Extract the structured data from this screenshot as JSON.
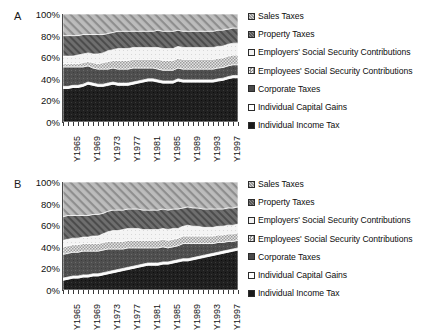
{
  "figure": {
    "panels": [
      {
        "id": "A",
        "label": "A"
      },
      {
        "id": "B",
        "label": "B"
      }
    ]
  },
  "axis": {
    "y_ticks": [
      "100%",
      "80%",
      "60%",
      "40%",
      "20%",
      "0%"
    ],
    "x_ticks": [
      "Y1965",
      "Y1969",
      "Y1973",
      "Y1977",
      "Y1981",
      "Y1985",
      "Y1989",
      "Y1993",
      "Y1997"
    ]
  },
  "legend": {
    "items": [
      {
        "label": "Sales Taxes",
        "swatch": "diagonal-hatch-medium",
        "color": "#9a9a9a"
      },
      {
        "label": "Property Taxes",
        "swatch": "dark-diagonal-hatch",
        "color": "#5a5a5a"
      },
      {
        "label": "Employers' Social Security Contributions",
        "swatch": "white-solid",
        "color": "#f2f2f2"
      },
      {
        "label": "Employees' Social Security Contributions",
        "swatch": "checker-grid",
        "color": "#bdbdbd"
      },
      {
        "label": "Corporate Taxes",
        "swatch": "dark-solid-grey",
        "color": "#4a4a4a"
      },
      {
        "label": "Individual Capital Gains",
        "swatch": "white-outline",
        "color": "#ffffff"
      },
      {
        "label": "Individual Income Tax",
        "swatch": "black-solid",
        "color": "#1a1a1a"
      }
    ]
  },
  "chart_data": [
    {
      "type": "area",
      "panel": "A",
      "title": "",
      "xlabel": "",
      "ylabel": "",
      "ylim": [
        0,
        100
      ],
      "stacked": true,
      "normalized_percent": true,
      "grid": false,
      "legend_position": "right",
      "x": [
        "Y1964",
        "Y1965",
        "Y1966",
        "Y1967",
        "Y1968",
        "Y1969",
        "Y1970",
        "Y1971",
        "Y1972",
        "Y1973",
        "Y1974",
        "Y1975",
        "Y1976",
        "Y1977",
        "Y1978",
        "Y1979",
        "Y1980",
        "Y1981",
        "Y1982",
        "Y1983",
        "Y1984",
        "Y1985",
        "Y1986",
        "Y1987",
        "Y1988",
        "Y1989",
        "Y1990",
        "Y1991",
        "Y1992",
        "Y1993",
        "Y1994",
        "Y1995",
        "Y1996",
        "Y1997",
        "Y1998",
        "Y1999"
      ],
      "series": [
        {
          "name": "Individual Income Tax",
          "values": [
            31,
            31,
            32,
            32,
            33,
            35,
            34,
            33,
            33,
            34,
            35,
            34,
            34,
            34,
            35,
            36,
            37,
            38,
            38,
            37,
            36,
            36,
            36,
            38,
            37,
            37,
            37,
            37,
            37,
            37,
            37,
            38,
            39,
            40,
            41,
            41
          ]
        },
        {
          "name": "Individual Capital Gains",
          "values": [
            2,
            2,
            2,
            2,
            2,
            2,
            2,
            2,
            2,
            2,
            2,
            2,
            2,
            2,
            2,
            2,
            2,
            2,
            2,
            2,
            2,
            2,
            2,
            2,
            2,
            2,
            2,
            2,
            2,
            2,
            2,
            2,
            2,
            2,
            2,
            2
          ]
        },
        {
          "name": "Corporate Taxes",
          "values": [
            18,
            18,
            17,
            17,
            16,
            15,
            14,
            14,
            14,
            13,
            13,
            13,
            13,
            13,
            13,
            12,
            11,
            10,
            10,
            10,
            10,
            10,
            10,
            10,
            10,
            10,
            10,
            10,
            10,
            10,
            10,
            10,
            10,
            10,
            10,
            10
          ]
        },
        {
          "name": "Employees' Social Security Contributions",
          "values": [
            3,
            3,
            3,
            3,
            4,
            4,
            5,
            5,
            6,
            7,
            7,
            8,
            8,
            8,
            8,
            8,
            8,
            8,
            8,
            9,
            9,
            9,
            9,
            9,
            9,
            9,
            9,
            9,
            9,
            9,
            9,
            9,
            9,
            9,
            9,
            9
          ]
        },
        {
          "name": "Employers' Social Security Contributions",
          "values": [
            7,
            7,
            7,
            8,
            8,
            8,
            8,
            9,
            9,
            10,
            10,
            11,
            11,
            11,
            11,
            11,
            11,
            11,
            11,
            11,
            11,
            11,
            11,
            11,
            11,
            11,
            11,
            11,
            11,
            11,
            11,
            11,
            11,
            11,
            11,
            11
          ]
        },
        {
          "name": "Property Taxes",
          "values": [
            19,
            19,
            19,
            18,
            18,
            17,
            18,
            18,
            17,
            16,
            16,
            16,
            16,
            16,
            15,
            15,
            15,
            15,
            15,
            16,
            16,
            16,
            16,
            15,
            15,
            15,
            15,
            15,
            15,
            15,
            15,
            15,
            15,
            14,
            14,
            14
          ]
        },
        {
          "name": "Sales Taxes",
          "values": [
            20,
            20,
            20,
            20,
            19,
            19,
            19,
            19,
            19,
            18,
            17,
            16,
            16,
            16,
            16,
            16,
            16,
            16,
            16,
            15,
            16,
            16,
            16,
            15,
            16,
            16,
            16,
            16,
            16,
            16,
            16,
            15,
            15,
            14,
            13,
            13
          ]
        }
      ]
    },
    {
      "type": "area",
      "panel": "B",
      "title": "",
      "xlabel": "",
      "ylabel": "",
      "ylim": [
        0,
        100
      ],
      "stacked": true,
      "normalized_percent": true,
      "grid": false,
      "legend_position": "right",
      "x": [
        "Y1964",
        "Y1965",
        "Y1966",
        "Y1967",
        "Y1968",
        "Y1969",
        "Y1970",
        "Y1971",
        "Y1972",
        "Y1973",
        "Y1974",
        "Y1975",
        "Y1976",
        "Y1977",
        "Y1978",
        "Y1979",
        "Y1980",
        "Y1981",
        "Y1982",
        "Y1983",
        "Y1984",
        "Y1985",
        "Y1986",
        "Y1987",
        "Y1988",
        "Y1989",
        "Y1990",
        "Y1991",
        "Y1992",
        "Y1993",
        "Y1994",
        "Y1995",
        "Y1996",
        "Y1997",
        "Y1998",
        "Y1999"
      ],
      "series": [
        {
          "name": "Individual Income Tax",
          "values": [
            9,
            10,
            11,
            11,
            12,
            12,
            13,
            13,
            14,
            15,
            16,
            17,
            18,
            19,
            20,
            21,
            22,
            23,
            23,
            23,
            24,
            24,
            25,
            26,
            27,
            27,
            28,
            29,
            30,
            31,
            32,
            33,
            34,
            35,
            36,
            37
          ]
        },
        {
          "name": "Individual Capital Gains",
          "values": [
            2,
            2,
            2,
            2,
            2,
            2,
            2,
            2,
            2,
            2,
            2,
            2,
            2,
            2,
            2,
            2,
            2,
            2,
            2,
            2,
            2,
            2,
            2,
            2,
            2,
            2,
            2,
            2,
            2,
            2,
            2,
            2,
            2,
            2,
            2,
            2
          ]
        },
        {
          "name": "Corporate Taxes",
          "values": [
            22,
            22,
            22,
            22,
            22,
            22,
            21,
            21,
            21,
            21,
            20,
            19,
            18,
            18,
            17,
            16,
            15,
            14,
            14,
            14,
            14,
            13,
            13,
            13,
            14,
            14,
            13,
            12,
            11,
            10,
            9,
            9,
            8,
            8,
            7,
            7
          ]
        },
        {
          "name": "Employees' Social Security Contributions",
          "values": [
            7,
            7,
            7,
            7,
            7,
            7,
            7,
            7,
            7,
            7,
            7,
            7,
            7,
            7,
            7,
            7,
            7,
            7,
            7,
            7,
            7,
            7,
            7,
            7,
            7,
            7,
            7,
            7,
            7,
            7,
            7,
            7,
            7,
            7,
            7,
            7
          ]
        },
        {
          "name": "Employers' Social Security Contributions",
          "values": [
            6,
            6,
            6,
            6,
            6,
            6,
            7,
            7,
            8,
            9,
            10,
            10,
            11,
            11,
            11,
            11,
            10,
            10,
            10,
            10,
            10,
            10,
            10,
            9,
            9,
            10,
            9,
            9,
            8,
            8,
            8,
            8,
            8,
            8,
            8,
            8
          ]
        },
        {
          "name": "Property Taxes",
          "values": [
            22,
            22,
            21,
            21,
            20,
            20,
            20,
            20,
            19,
            19,
            19,
            19,
            18,
            18,
            18,
            18,
            18,
            18,
            18,
            18,
            18,
            18,
            18,
            18,
            17,
            17,
            17,
            17,
            17,
            17,
            17,
            16,
            16,
            16,
            16,
            16
          ]
        },
        {
          "name": "Sales Taxes",
          "values": [
            32,
            31,
            31,
            31,
            31,
            31,
            30,
            30,
            29,
            27,
            26,
            26,
            26,
            25,
            25,
            25,
            26,
            26,
            26,
            26,
            25,
            26,
            25,
            25,
            24,
            23,
            24,
            24,
            25,
            25,
            25,
            25,
            25,
            24,
            24,
            23
          ]
        }
      ]
    }
  ]
}
